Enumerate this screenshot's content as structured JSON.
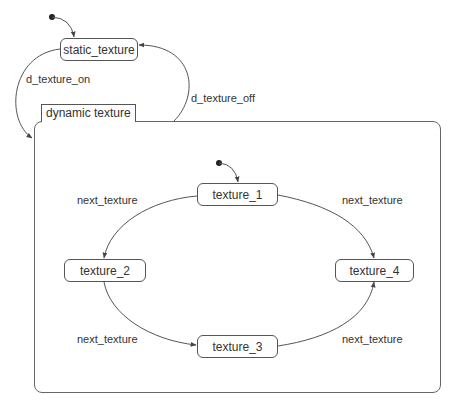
{
  "diagram": {
    "type": "state-machine",
    "states": {
      "static": "static_texture",
      "t1": "texture_1",
      "t2": "texture_2",
      "t3": "texture_3",
      "t4": "texture_4"
    },
    "composite": {
      "label": "dynamic texture"
    },
    "transitions": {
      "on": "d_texture_on",
      "off": "d_texture_off",
      "t1_t2": "next_texture",
      "t1_t4": "next_texture",
      "t2_t3": "next_texture",
      "t3_t4": "next_texture"
    },
    "colors": {
      "line": "#555555",
      "text": "#333333",
      "background": "#ffffff"
    }
  }
}
